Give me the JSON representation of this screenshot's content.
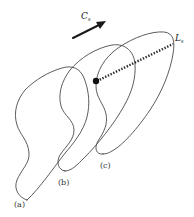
{
  "figure": {
    "arrow_label": {
      "main": "C",
      "sub": "s"
    },
    "line_label": {
      "main": "L",
      "sub": "s"
    },
    "shape_labels": {
      "a": "(a)",
      "b": "(b)",
      "c": "(c)"
    }
  },
  "colors": {
    "outline": "#4a4a4a",
    "arrow": "#1a1a1a",
    "background": "#ffffff"
  }
}
